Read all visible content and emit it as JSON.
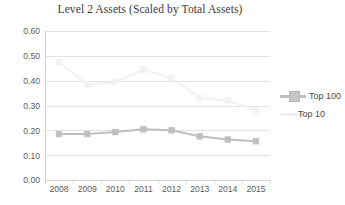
{
  "chart_data": {
    "type": "line",
    "title": "Level 2 Assets (Scaled by Total Assets)",
    "xlabel": "",
    "ylabel": "",
    "categories": [
      "2008",
      "2009",
      "2010",
      "2011",
      "2012",
      "2013",
      "2014",
      "2015"
    ],
    "ylim": [
      0.0,
      0.6
    ],
    "ytick_labels": [
      "0.60",
      "0.50",
      "0.40",
      "0.30",
      "0.20",
      "0.10",
      "0.00"
    ],
    "ytick_values": [
      0.6,
      0.5,
      0.4,
      0.3,
      0.2,
      0.1,
      0.0
    ],
    "grid": true,
    "legend_position": "right",
    "series": [
      {
        "name": "Top 100",
        "color": "#c0c0c0",
        "marker": "square",
        "values": [
          0.185,
          0.185,
          0.193,
          0.204,
          0.2,
          0.176,
          0.163,
          0.156
        ]
      },
      {
        "name": "Top 10",
        "color": "#f2f2f2",
        "marker": "square",
        "values": [
          0.475,
          0.385,
          0.395,
          0.445,
          0.41,
          0.33,
          0.32,
          0.28
        ]
      }
    ]
  },
  "legend": {
    "items": [
      {
        "label": "Top 100"
      },
      {
        "label": "Top 10"
      }
    ]
  }
}
